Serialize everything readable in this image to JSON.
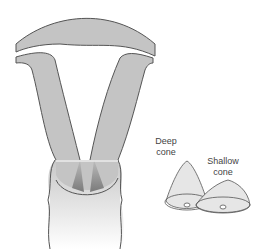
{
  "labels": {
    "deep_cone_line1": "Deep",
    "deep_cone_line2": "cone",
    "shallow_cone_line1": "Shallow",
    "shallow_cone_line2": "cone"
  },
  "colors": {
    "tissue": "#c4c4c4",
    "outline": "#555555",
    "shade": "#8a8a8a",
    "cone_fill": "#e6e6e6"
  }
}
